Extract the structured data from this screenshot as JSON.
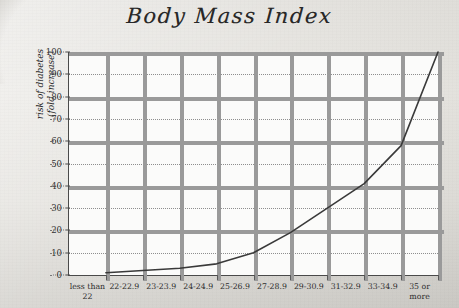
{
  "chart_data": {
    "type": "line",
    "title": "Body Mass Index",
    "xlabel": "",
    "ylabel": "risk of diabetes\n(fold increase)",
    "categories": [
      "less than\n22",
      "22-22.9",
      "23-23.9",
      "24-24.9",
      "25-26.9",
      "27-28.9",
      "29-30.9",
      "31-32.9",
      "33-34.9",
      "35 or\nmore"
    ],
    "values": [
      1,
      2,
      3,
      5,
      10,
      19,
      30,
      41,
      58,
      100
    ],
    "ylim": [
      0,
      100
    ],
    "yticks": [
      0,
      10,
      20,
      30,
      40,
      50,
      60,
      70,
      80,
      90,
      100
    ],
    "ytick_labels": [
      "0",
      "10",
      "20",
      "30",
      "40",
      "50",
      "60",
      "70",
      "80",
      "90",
      "100"
    ],
    "grid": true,
    "legend": false,
    "line_color": "#3a3a3a",
    "plot_background": "#fbfbfa",
    "page_background": "#e2e0db"
  }
}
